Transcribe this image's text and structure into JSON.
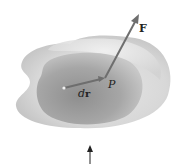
{
  "figure": {
    "labels": {
      "force": "F",
      "point": "P",
      "displacement_d": "d",
      "displacement_r": "r"
    },
    "colors": {
      "outer_surface": "#d9d9d9",
      "inner_surface": "#a9a9a9",
      "vector": "#6e6e6e",
      "bottom_arrow": "#222222"
    }
  }
}
